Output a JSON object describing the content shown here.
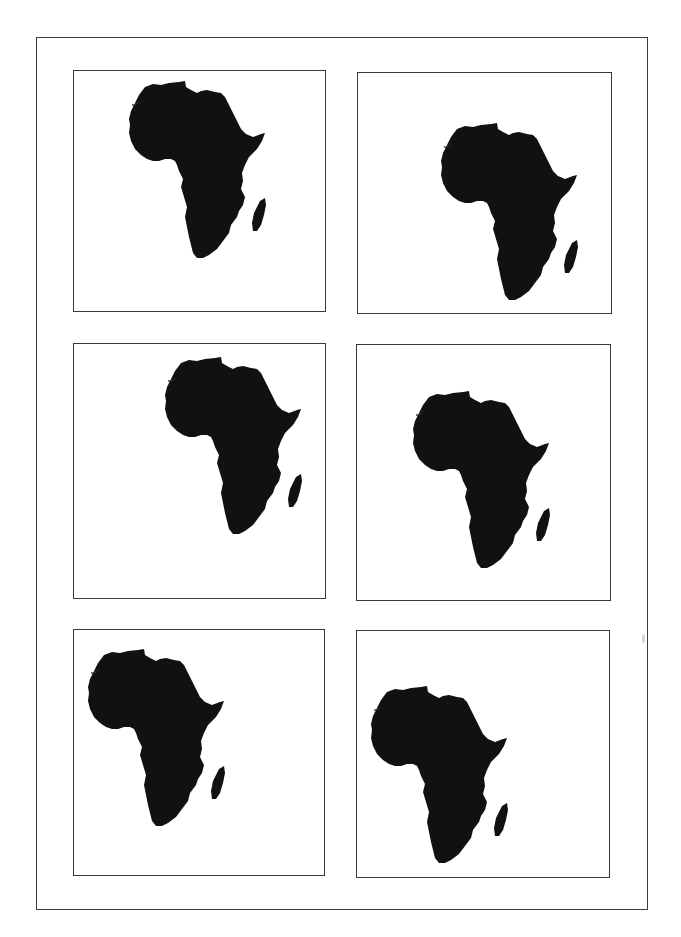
{
  "page": {
    "title": "",
    "background": "#ffffff",
    "border_color": "#3a3a3a",
    "fill_color": "#111111"
  },
  "panels": [
    {
      "id": 1,
      "subject": "africa-silhouette",
      "row": 1,
      "col": 1,
      "box": [
        73,
        70,
        253,
        242
      ],
      "map_offset": [
        129,
        81
      ]
    },
    {
      "id": 2,
      "subject": "africa-silhouette",
      "row": 1,
      "col": 2,
      "box": [
        357,
        72,
        255,
        242
      ],
      "map_offset": [
        441,
        123
      ]
    },
    {
      "id": 3,
      "subject": "africa-silhouette",
      "row": 2,
      "col": 1,
      "box": [
        73,
        343,
        253,
        256
      ],
      "map_offset": [
        165,
        357
      ]
    },
    {
      "id": 4,
      "subject": "africa-silhouette",
      "row": 2,
      "col": 2,
      "box": [
        356,
        344,
        255,
        257
      ],
      "map_offset": [
        413,
        391
      ]
    },
    {
      "id": 5,
      "subject": "africa-silhouette",
      "row": 3,
      "col": 1,
      "box": [
        73,
        629,
        252,
        247
      ],
      "map_offset": [
        88,
        649
      ]
    },
    {
      "id": 6,
      "subject": "africa-silhouette",
      "row": 3,
      "col": 2,
      "box": [
        356,
        630,
        254,
        248
      ],
      "map_offset": [
        371,
        686
      ]
    }
  ]
}
